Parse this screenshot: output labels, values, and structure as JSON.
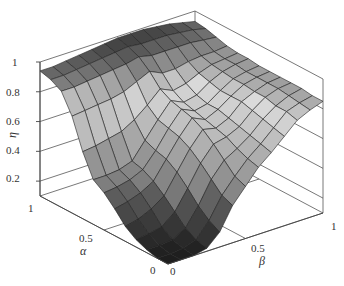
{
  "chart_data": {
    "type": "surface3d",
    "title": "",
    "xlabel": "β",
    "ylabel": "α",
    "zlabel": "η",
    "x_ticks": [
      "0",
      "0.5",
      "1"
    ],
    "y_ticks": [
      "0",
      "0.5",
      "1"
    ],
    "z_ticks": [
      "0.2",
      "0.4",
      "0.6",
      "0.8",
      "1"
    ],
    "xlim": [
      0,
      1
    ],
    "ylim": [
      0,
      1
    ],
    "zlim": [
      0.1,
      1
    ],
    "grid": true,
    "colormap": "gray",
    "x": [
      0,
      0.0833,
      0.1667,
      0.25,
      0.3333,
      0.4167,
      0.5,
      0.5833,
      0.6667,
      0.75,
      0.8333,
      0.9167,
      1
    ],
    "y": [
      0,
      0.0833,
      0.1667,
      0.25,
      0.3333,
      0.4167,
      0.5,
      0.5833,
      0.6667,
      0.75,
      0.8333,
      0.9167,
      1
    ],
    "z_description": "eta(alpha,beta): low (~0.1) for small alpha and small beta; rises to a plateau ~0.9-1.0 for large alpha; ridge ~0.7 around beta 0.5; plateau ~0.85 for large beta",
    "z": [
      [
        0.1,
        0.1,
        0.1,
        0.12,
        0.2,
        0.35,
        0.45,
        0.55,
        0.62,
        0.7,
        0.78,
        0.82,
        0.85
      ],
      [
        0.1,
        0.1,
        0.11,
        0.14,
        0.24,
        0.38,
        0.48,
        0.57,
        0.64,
        0.72,
        0.8,
        0.83,
        0.85
      ],
      [
        0.12,
        0.12,
        0.13,
        0.18,
        0.3,
        0.45,
        0.55,
        0.6,
        0.66,
        0.74,
        0.8,
        0.84,
        0.86
      ],
      [
        0.15,
        0.16,
        0.18,
        0.25,
        0.38,
        0.52,
        0.62,
        0.64,
        0.68,
        0.76,
        0.82,
        0.85,
        0.86
      ],
      [
        0.2,
        0.22,
        0.26,
        0.32,
        0.45,
        0.58,
        0.68,
        0.66,
        0.7,
        0.78,
        0.82,
        0.85,
        0.86
      ],
      [
        0.28,
        0.3,
        0.33,
        0.38,
        0.5,
        0.62,
        0.72,
        0.68,
        0.72,
        0.78,
        0.83,
        0.85,
        0.86
      ],
      [
        0.35,
        0.36,
        0.38,
        0.42,
        0.52,
        0.64,
        0.74,
        0.7,
        0.72,
        0.78,
        0.83,
        0.85,
        0.86
      ],
      [
        0.4,
        0.4,
        0.41,
        0.44,
        0.55,
        0.66,
        0.76,
        0.72,
        0.74,
        0.8,
        0.84,
        0.86,
        0.87
      ],
      [
        0.55,
        0.56,
        0.58,
        0.6,
        0.65,
        0.72,
        0.8,
        0.76,
        0.78,
        0.82,
        0.85,
        0.86,
        0.87
      ],
      [
        0.75,
        0.76,
        0.77,
        0.78,
        0.8,
        0.84,
        0.88,
        0.84,
        0.84,
        0.86,
        0.87,
        0.87,
        0.88
      ],
      [
        0.88,
        0.88,
        0.89,
        0.9,
        0.91,
        0.92,
        0.94,
        0.92,
        0.92,
        0.92,
        0.92,
        0.91,
        0.9
      ],
      [
        0.92,
        0.92,
        0.93,
        0.94,
        0.95,
        0.96,
        0.97,
        0.96,
        0.96,
        0.96,
        0.95,
        0.94,
        0.92
      ],
      [
        0.94,
        0.94,
        0.95,
        0.96,
        0.97,
        0.98,
        0.99,
        0.99,
        0.99,
        0.98,
        0.97,
        0.95,
        0.93
      ]
    ]
  },
  "axes": {
    "z_label": "η",
    "alpha_label": "α",
    "beta_label": "β",
    "z_tick_labels": [
      "0.2",
      "0.4",
      "0.6",
      "0.8",
      "1"
    ],
    "alpha_tick_labels": [
      "1",
      "0.5",
      "0"
    ],
    "beta_tick_labels": [
      "0",
      "0.5",
      "1"
    ]
  }
}
